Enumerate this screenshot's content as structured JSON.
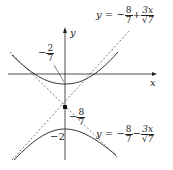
{
  "axes": {
    "x_label": "x",
    "y_label": "y"
  },
  "labels": {
    "upper_vertex": {
      "sign": "−",
      "num": "2",
      "den": "7"
    },
    "center": {
      "sign": "−",
      "num": "8",
      "den": "7"
    },
    "lower_vertex": "−2",
    "asymptote_upper": {
      "lhs": "y = −",
      "num1": "8",
      "den1": "7",
      "op": "+",
      "num2": "3x",
      "den2": "√7"
    },
    "asymptote_lower": {
      "lhs": "y = −",
      "num1": "8",
      "den1": "7",
      "op": "−",
      "num2": "3x",
      "den2": "√7"
    }
  },
  "colors": {
    "curve": "#333333",
    "asymptote": "#555555",
    "axis": "#222222"
  }
}
